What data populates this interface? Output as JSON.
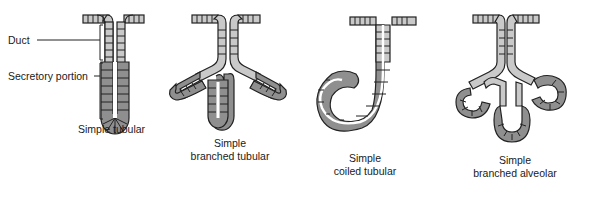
{
  "diagram": {
    "title": "",
    "colors": {
      "duct_cell": "#c9c9c9",
      "secretory_cell": "#8f8f8f",
      "outline": "#222222",
      "lumen": "#ffffff",
      "background": "#ffffff"
    },
    "labels": {
      "duct": "Duct",
      "secretory_portion": "Secretory portion"
    },
    "glands": [
      {
        "id": "simple-tubular",
        "caption": [
          "Simple tubular"
        ]
      },
      {
        "id": "simple-branched-tubular",
        "caption": [
          "Simple",
          "branched tubular"
        ]
      },
      {
        "id": "simple-coiled-tubular",
        "caption": [
          "Simple",
          "coiled tubular"
        ]
      },
      {
        "id": "simple-branched-alveolar",
        "caption": [
          "Simple",
          "branched alveolar"
        ]
      }
    ]
  }
}
